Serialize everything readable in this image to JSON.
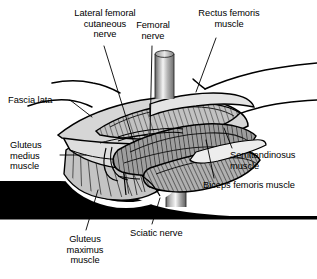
{
  "figure": {
    "type": "anatomical-illustration",
    "background_color": "#ffffff",
    "line_color": "#000000"
  },
  "labels": [
    {
      "id": "lateral-femoral-cutaneous-nerve",
      "text": "Lateral femoral\ncutaneous\nnerve",
      "align": "center",
      "x": 56,
      "y": 8,
      "width": 98
    },
    {
      "id": "femoral-nerve",
      "text": "Femoral\nnerve",
      "align": "center",
      "x": 126,
      "y": 20,
      "width": 54
    },
    {
      "id": "rectus-femoris-muscle",
      "text": "Rectus femoris\nmuscle",
      "align": "center",
      "x": 185,
      "y": 8,
      "width": 88
    },
    {
      "id": "fascia-lata",
      "text": "Fascia lata",
      "align": "left",
      "x": 8,
      "y": 95,
      "width": 60
    },
    {
      "id": "gluteus-medius-muscle",
      "text": "Gluteus\nmedius\nmuscle",
      "align": "left",
      "x": 10,
      "y": 140,
      "width": 48
    },
    {
      "id": "superior-gluteal-nerve",
      "text": "Superior\ngluteal\nnerve",
      "align": "left",
      "x": 8,
      "y": 184,
      "width": 52
    },
    {
      "id": "gluteus-maximus-muscle",
      "text": "Gluteus\nmaximus\nmuscle",
      "align": "center",
      "x": 56,
      "y": 234,
      "width": 56
    },
    {
      "id": "sciatic-nerve",
      "text": "Sciatic nerve",
      "align": "left",
      "x": 130,
      "y": 228,
      "width": 70
    },
    {
      "id": "semitendinosus-muscle",
      "text": "Semitendinosus\nmuscle",
      "align": "left",
      "x": 230,
      "y": 150,
      "width": 84
    },
    {
      "id": "biceps-femoris-muscle",
      "text": "Biceps femoris muscle",
      "align": "left",
      "x": 203,
      "y": 180,
      "width": 112
    }
  ],
  "colors": {
    "outline": "#000000",
    "fascia_fill": "#dcdcdc",
    "muscle_light": "#c8c8c8",
    "muscle_mid": "#a8a8a8",
    "muscle_dark": "#888888",
    "silhouette": "#000000",
    "highlight": "#ffffff",
    "retractor_light": "#f2f2f2",
    "retractor_dark": "#6a6a6a"
  },
  "structures": [
    {
      "id": "skin-edge-upper-right",
      "name": "skin edge (upper right)"
    },
    {
      "id": "skin-edge-lower-right",
      "name": "skin edge (lower right)"
    },
    {
      "id": "skin-edge-left",
      "name": "skin edge (left)"
    },
    {
      "id": "fascia-lata-flap",
      "name": "reflected fascia lata flap"
    },
    {
      "id": "rectus-femoris-belly",
      "name": "rectus femoris muscle belly"
    },
    {
      "id": "biceps-femoris-belly",
      "name": "biceps femoris muscle belly"
    },
    {
      "id": "semitendinosus-belly",
      "name": "semitendinosus muscle belly"
    },
    {
      "id": "gluteus-medius-fan",
      "name": "gluteus medius fan-striated muscle"
    },
    {
      "id": "gluteus-maximus-silhouette",
      "name": "gluteus maximus black silhouette"
    },
    {
      "id": "retractor-post-upper",
      "name": "upper retractor post"
    },
    {
      "id": "retractor-post-lower",
      "name": "lower retractor post"
    },
    {
      "id": "femoral-nerve-strand",
      "name": "femoral nerve strand"
    },
    {
      "id": "lateral-femoral-cutaneous-strand",
      "name": "lateral femoral cutaneous nerve strand"
    },
    {
      "id": "superior-gluteal-nerve-strand",
      "name": "superior gluteal nerve strand"
    },
    {
      "id": "sciatic-nerve-strand",
      "name": "sciatic nerve strand"
    }
  ]
}
